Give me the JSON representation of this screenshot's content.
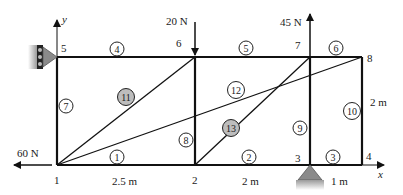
{
  "diagram": {
    "type": "truss",
    "axes": {
      "x_label": "x",
      "y_label": "y"
    },
    "nodes": [
      {
        "id": "1",
        "label": "1",
        "x": 57,
        "y": 165,
        "lx": 54,
        "ly": 184
      },
      {
        "id": "2",
        "label": "2",
        "x": 195,
        "y": 165,
        "lx": 192,
        "ly": 184
      },
      {
        "id": "3",
        "label": "3",
        "x": 310,
        "y": 165,
        "lx": 295,
        "ly": 162
      },
      {
        "id": "4",
        "label": "4",
        "x": 362,
        "y": 165,
        "lx": 366,
        "ly": 160
      },
      {
        "id": "5",
        "label": "5",
        "x": 57,
        "y": 57,
        "lx": 61,
        "ly": 52
      },
      {
        "id": "6",
        "label": "6",
        "x": 195,
        "y": 57,
        "lx": 176,
        "ly": 47
      },
      {
        "id": "7",
        "label": "7",
        "x": 310,
        "y": 57,
        "lx": 295,
        "ly": 49
      },
      {
        "id": "8",
        "label": "8",
        "x": 362,
        "y": 57,
        "lx": 367,
        "ly": 62
      }
    ],
    "members": [
      {
        "id": "1",
        "label": "1",
        "from": "1",
        "to": "2",
        "cx": 117,
        "cy": 157,
        "shaded": false
      },
      {
        "id": "2",
        "label": "2",
        "from": "2",
        "to": "3",
        "cx": 249,
        "cy": 157,
        "shaded": false
      },
      {
        "id": "3",
        "label": "3",
        "from": "3",
        "to": "4",
        "cx": 333,
        "cy": 157,
        "shaded": false
      },
      {
        "id": "4",
        "label": "4",
        "from": "5",
        "to": "6",
        "cx": 117,
        "cy": 49,
        "shaded": false
      },
      {
        "id": "5",
        "label": "5",
        "from": "6",
        "to": "7",
        "cx": 246,
        "cy": 48,
        "shaded": false
      },
      {
        "id": "6",
        "label": "6",
        "from": "7",
        "to": "8",
        "cx": 336,
        "cy": 48,
        "shaded": false
      },
      {
        "id": "7",
        "label": "7",
        "from": "1",
        "to": "5",
        "cx": 66,
        "cy": 106,
        "shaded": false
      },
      {
        "id": "8",
        "label": "8",
        "from": "2",
        "to": "6",
        "cx": 186,
        "cy": 140,
        "shaded": false
      },
      {
        "id": "9",
        "label": "9",
        "from": "3",
        "to": "7",
        "cx": 300,
        "cy": 128,
        "shaded": false
      },
      {
        "id": "10",
        "label": "10",
        "from": "4",
        "to": "8",
        "cx": 352,
        "cy": 111,
        "shaded": false
      },
      {
        "id": "11",
        "label": "11",
        "from": "1",
        "to": "6",
        "cx": 126,
        "cy": 97,
        "shaded": true
      },
      {
        "id": "12",
        "label": "12",
        "from": "1",
        "to": "8",
        "cx": 236,
        "cy": 90,
        "shaded": false
      },
      {
        "id": "13",
        "label": "13",
        "from": "2",
        "to": "7",
        "cx": 231,
        "cy": 128,
        "shaded": true
      }
    ],
    "loads": [
      {
        "id": "f6",
        "label": "20 N",
        "node": "6",
        "direction": "down"
      },
      {
        "id": "f7",
        "label": "45 N",
        "node": "7",
        "direction": "up"
      },
      {
        "id": "f1",
        "label": "60 N",
        "node": "1",
        "direction": "left"
      }
    ],
    "dimensions": [
      {
        "label": "2.5 m",
        "x": 132,
        "y": 185
      },
      {
        "label": "2 m",
        "x": 254,
        "y": 185
      },
      {
        "label": "1 m",
        "x": 342,
        "y": 185
      },
      {
        "label": "2 m",
        "x": 370,
        "y": 105
      }
    ],
    "supports": [
      {
        "type": "roller-wall",
        "node": "5"
      },
      {
        "type": "pin",
        "node": "3"
      }
    ],
    "colors": {
      "line": "#111111",
      "shaded_circle": "#bdbdbd",
      "support": "#8a8a8a"
    }
  }
}
